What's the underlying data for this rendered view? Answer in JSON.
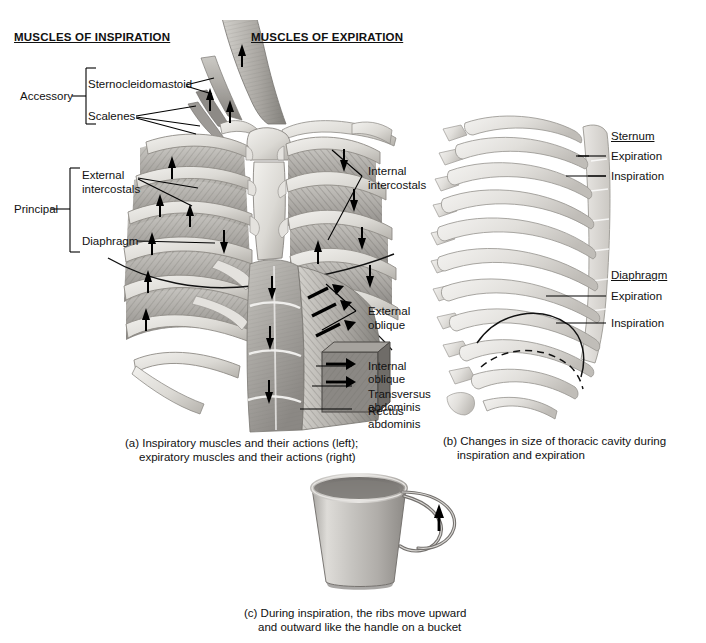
{
  "figure": {
    "headings": [
      {
        "text": "MUSCLES OF INSPIRATION"
      },
      {
        "text": "MUSCLES OF EXPIRATION"
      }
    ],
    "panel_a": {
      "group_labels": [
        {
          "text": "Accessory"
        },
        {
          "text": "Principal"
        }
      ],
      "inspiration_muscles": [
        {
          "text": "Sternocleidomastoid"
        },
        {
          "text": "Scalenes"
        },
        {
          "text": "External"
        },
        {
          "text": "intercostals"
        },
        {
          "text": "Diaphragm"
        }
      ],
      "expiration_muscles": [
        {
          "text": "Internal"
        },
        {
          "text": "intercostals"
        },
        {
          "text": "External"
        },
        {
          "text": "oblique"
        },
        {
          "text": "Internal"
        },
        {
          "text": "oblique"
        },
        {
          "text": "Transversus"
        },
        {
          "text": "abdominis"
        },
        {
          "text": "Rectus"
        },
        {
          "text": "abdominis"
        }
      ],
      "caption_line1": "(a) Inspiratory muscles and their actions (left);",
      "caption_line2": "expiratory muscles and their actions (right)"
    },
    "panel_b": {
      "sternum_title": "Sternum",
      "sternum_states": [
        {
          "text": "Expiration"
        },
        {
          "text": "Inspiration"
        }
      ],
      "diaphragm_title": "Diaphragm",
      "diaphragm_states": [
        {
          "text": "Expiration"
        },
        {
          "text": "Inspiration"
        }
      ],
      "caption_line1": "(b) Changes in size of thoracic cavity during",
      "caption_line2": "inspiration and expiration"
    },
    "panel_c": {
      "caption_line1": "(c) During inspiration, the ribs move upward",
      "caption_line2": "and outward like the handle on a bucket"
    },
    "colors": {
      "ink": "#000000",
      "bone_light": "#e8e7e4",
      "bone_mid": "#cfcdc8",
      "bone_dark": "#a9a6a0",
      "muscle_light": "#cdcbc6",
      "muscle_mid": "#9d9a95",
      "muscle_dark": "#6d6a66",
      "background": "#ffffff"
    }
  }
}
